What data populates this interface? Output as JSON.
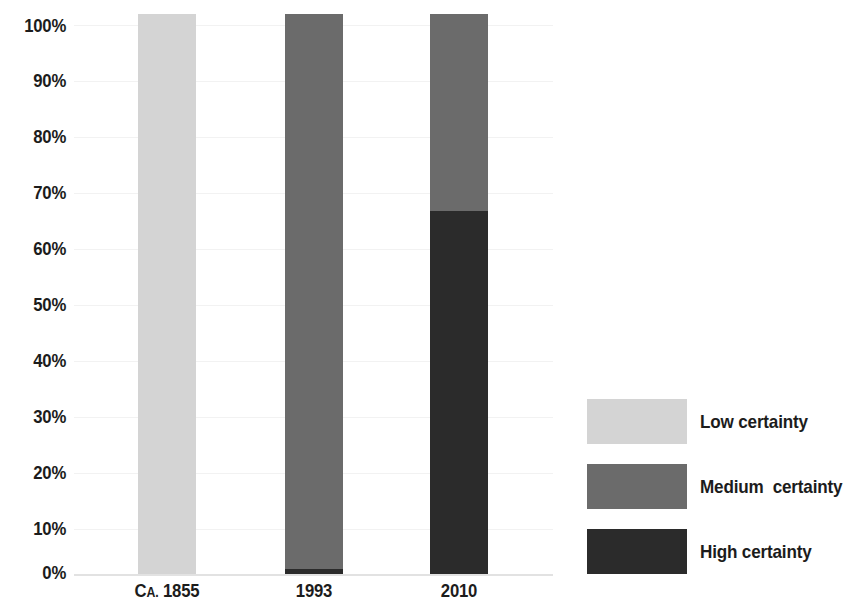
{
  "chart_data": {
    "type": "bar",
    "subtype": "stacked-bar-100-percent",
    "title": "",
    "subtitle": "",
    "xlabel": "",
    "ylabel": "",
    "categories": [
      "Ca. 1855",
      "1993",
      "2010"
    ],
    "category_display": [
      {
        "lead": "C",
        "smallcaps": "A.",
        "rest": " 1855"
      },
      {
        "lead": "1993",
        "smallcaps": "",
        "rest": ""
      },
      {
        "lead": "2010",
        "smallcaps": "",
        "rest": ""
      }
    ],
    "series": [
      {
        "name": "Low certainty",
        "values": [
          100,
          0,
          0
        ],
        "color": "#d4d4d4"
      },
      {
        "name": "Medium certainty",
        "values": [
          0,
          98.7,
          35
        ],
        "color": "#6b6b6b"
      },
      {
        "name": "High certainty",
        "values": [
          0,
          1.3,
          65
        ],
        "color": "#2b2b2b"
      }
    ],
    "stack_order_bottom_to_top": [
      "High certainty",
      "Medium certainty",
      "Low certainty"
    ],
    "ylim": [
      0,
      100
    ],
    "y_ticks": [
      0,
      10,
      20,
      30,
      40,
      50,
      60,
      70,
      80,
      90,
      100
    ],
    "y_tick_labels": [
      "0%",
      "10%",
      "20%",
      "30%",
      "40%",
      "50%",
      "60%",
      "70%",
      "80%",
      "90%",
      "100%"
    ],
    "grid": true,
    "grid_color": "#f2f2f2",
    "axis_line_color": "#e2e2e2",
    "legend_position": "right",
    "legend_entries": [
      {
        "label": "Low certainty",
        "color": "#d4d4d4"
      },
      {
        "label": "Medium  certainty",
        "color": "#6b6b6b"
      },
      {
        "label": "High certainty",
        "color": "#2b2b2b"
      }
    ],
    "background_color": "#ffffff",
    "text_color": "#1c1c1c"
  },
  "y_axis": {
    "t100": "100%",
    "t90": "90%",
    "t80": "80%",
    "t70": "70%",
    "t60": "60%",
    "t50": "50%",
    "t40": "40%",
    "t30": "30%",
    "t20": "20%",
    "t10": "10%",
    "t0": "0%"
  },
  "x_axis": {
    "label1_lead": "C",
    "label1_small": "A.",
    "label1_rest": " 1855",
    "label2": "1993",
    "label3": "2010"
  },
  "legend": {
    "item1": "Low certainty",
    "item2": "Medium  certainty",
    "item3": "High certainty"
  }
}
